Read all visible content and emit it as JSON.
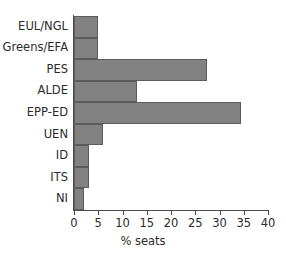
{
  "chart_data": {
    "type": "bar",
    "orientation": "horizontal",
    "title": "",
    "xlabel": "% seats",
    "ylabel": "",
    "categories": [
      "EUL/NGL",
      "Greens/EFA",
      "PES",
      "ALDE",
      "EPP-ED",
      "UEN",
      "ID",
      "ITS",
      "NI"
    ],
    "values": [
      5.0,
      5.0,
      27.5,
      13.0,
      34.5,
      6.0,
      3.0,
      3.0,
      2.0
    ],
    "xlim": [
      0,
      40
    ],
    "xticks": [
      0,
      5,
      10,
      15,
      20,
      25,
      30,
      35,
      40
    ],
    "xtick_labels": [
      "0",
      "5",
      "10",
      "15",
      "20",
      "25",
      "30",
      "35",
      "40"
    ],
    "grid": false,
    "legend": null,
    "bar_color": "#828282",
    "bar_edge_color": "#5c5c5c",
    "axis_color": "#4a4a4a",
    "text_color": "#2b2b2b",
    "background_color": "#ffffff"
  }
}
